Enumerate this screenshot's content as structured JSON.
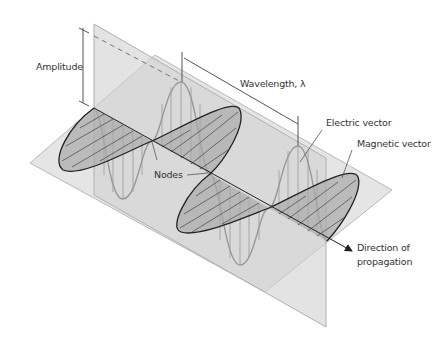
{
  "diagram": {
    "labels": {
      "amplitude": "Amplitude",
      "wavelength": "Wavelength, λ",
      "electric_vector": "Electric vector",
      "magnetic_vector": "Magnetic vector",
      "nodes": "Nodes",
      "direction_line1": "Direction of",
      "direction_line2": "propagation"
    },
    "colors": {
      "background": "#ffffff",
      "plane_fill": "#d9d9d9",
      "plane_edge": "#b0b0b0",
      "electric_wave": "#8a8a8a",
      "magnetic_wave": "#222222",
      "magnetic_fill": "#a8a8a8",
      "label_text": "#333333"
    }
  }
}
